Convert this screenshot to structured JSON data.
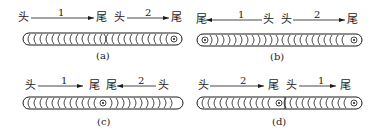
{
  "figure": {
    "panels": [
      {
        "id": "a",
        "caption": "(a)",
        "segments": [
          {
            "number": "1",
            "start_label": "头",
            "end_label": "尾",
            "direction": "right"
          },
          {
            "number": "2",
            "start_label": "头",
            "end_label": "尾",
            "direction": "right"
          }
        ],
        "weld_pattern": "both segments arcs open to the right; crater circle at right end; overlap mark in center"
      },
      {
        "id": "b",
        "caption": "(b)",
        "segments": [
          {
            "number": "1",
            "start_label": "头",
            "end_label": "尾",
            "direction": "left"
          },
          {
            "number": "2",
            "start_label": "头",
            "end_label": "尾",
            "direction": "right"
          }
        ],
        "weld_pattern": "starts at center; crater circles at both ends"
      },
      {
        "id": "c",
        "caption": "(c)",
        "segments": [
          {
            "number": "1",
            "start_label": "头",
            "end_label": "尾",
            "direction": "right"
          },
          {
            "number": "2",
            "start_label": "头",
            "end_label": "尾",
            "direction": "left"
          }
        ],
        "weld_pattern": "starts at both ends; crater circle at center"
      },
      {
        "id": "d",
        "caption": "(d)",
        "segments": [
          {
            "number": "2",
            "start_label": "头",
            "end_label": "尾",
            "direction": "right"
          },
          {
            "number": "1",
            "start_label": "头",
            "end_label": "尾",
            "direction": "right"
          }
        ],
        "weld_pattern": "segmented back-step; crater circles at center and right end"
      }
    ]
  },
  "labels": {
    "a": {
      "s1_head": "头",
      "s1_num": "1",
      "s1_tail": "尾",
      "s2_head": "头",
      "s2_num": "2",
      "s2_tail": "尾",
      "caption": "(a)"
    },
    "b": {
      "s1_tail": "尾",
      "s1_num": "1",
      "s1_head": "头",
      "s2_head": "头",
      "s2_num": "2",
      "s2_tail": "尾",
      "caption": "(b)"
    },
    "c": {
      "s1_head": "头",
      "s1_num": "1",
      "s1_tail": "尾",
      "s2_tail": "尾",
      "s2_num": "2",
      "s2_head": "头",
      "caption": "(c)"
    },
    "d": {
      "s1_head": "头",
      "s1_num": "2",
      "s1_tail": "尾",
      "s2_head": "头",
      "s2_num": "1",
      "s2_tail": "尾",
      "caption": "(d)"
    }
  }
}
